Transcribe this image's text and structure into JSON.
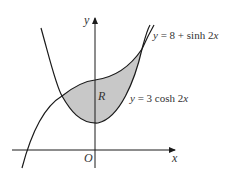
{
  "diagram": {
    "axes": {
      "x_label": "x",
      "y_label": "y",
      "origin_label": "O"
    },
    "curves": [
      {
        "id": "sinh",
        "label": "y = 8 + sinh 2x",
        "label_parts": [
          "y",
          " = 8 + sinh 2",
          "x"
        ]
      },
      {
        "id": "cosh",
        "label": "y = 3 cosh 2x",
        "label_parts": [
          "y",
          " = 3 cosh 2",
          "x"
        ]
      }
    ],
    "region": {
      "label": "R",
      "fill": "#c8c8c8"
    },
    "colors": {
      "stroke": "#1a1a1a",
      "shade": "#c8c8c8",
      "text": "#333333"
    }
  }
}
